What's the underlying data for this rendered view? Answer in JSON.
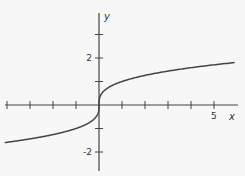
{
  "chart_data": {
    "type": "line",
    "title": "",
    "function": "y = cube root of x",
    "xlabel": "x",
    "ylabel": "y",
    "xlim": [
      -4.2,
      5.9
    ],
    "ylim": [
      -2.8,
      3.9
    ],
    "x_ticks": [
      -4,
      -3,
      -2,
      -1,
      1,
      2,
      3,
      4,
      5
    ],
    "x_tick_labels": [
      {
        "value": 5,
        "label": "5"
      }
    ],
    "y_ticks": [
      -2,
      -1,
      1,
      2,
      3
    ],
    "y_tick_labels": [
      {
        "value": 2,
        "label": "2"
      },
      {
        "value": -2,
        "label": "-2"
      }
    ],
    "grid": false,
    "series": [
      {
        "name": "cbrt(x)",
        "x": [
          -4.1,
          -3,
          -2,
          -1,
          -0.5,
          -0.1,
          -0.01,
          0,
          0.01,
          0.1,
          0.5,
          1,
          2,
          3,
          4,
          5,
          5.9
        ],
        "y": [
          -1.6,
          -1.44,
          -1.26,
          -1.0,
          -0.79,
          -0.46,
          -0.22,
          0,
          0.22,
          0.46,
          0.79,
          1.0,
          1.26,
          1.44,
          1.59,
          1.71,
          1.81
        ]
      }
    ],
    "colors": {
      "axis": "#444444",
      "curve": "#444444",
      "background": "#f7f7f7"
    }
  }
}
